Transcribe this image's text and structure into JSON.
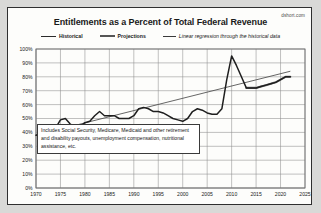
{
  "watermark": "dshort.com",
  "chart_data": {
    "type": "line",
    "title": "Entitlements as a Percent of Total Federal Revenue",
    "xlabel": "",
    "ylabel": "",
    "xlim": [
      1970,
      2025
    ],
    "ylim": [
      0,
      100
    ],
    "grid": true,
    "legend_position": "top",
    "xticks": [
      "1970",
      "1975",
      "1980",
      "1985",
      "1990",
      "1995",
      "2000",
      "2005",
      "2010",
      "2015",
      "2020",
      "2025"
    ],
    "yticks": [
      "0%",
      "10%",
      "20%",
      "30%",
      "40%",
      "50%",
      "60%",
      "70%",
      "80%",
      "90%",
      "100%"
    ],
    "legend": [
      {
        "name": "Historical",
        "style": "solid-dark"
      },
      {
        "name": "Projections",
        "style": "thick-gray"
      },
      {
        "name": "Linear regression through the historical data",
        "style": "thin-line-italic"
      }
    ],
    "annotation": "Includes Social Security, Medicare, Medicaid and other retirement and disability payouts, unemployment compensation, nutritional assistance, etc.",
    "series": [
      {
        "name": "Historical",
        "x": [
          1970,
          1971,
          1972,
          1973,
          1974,
          1975,
          1976,
          1977,
          1978,
          1979,
          1980,
          1981,
          1982,
          1983,
          1984,
          1985,
          1986,
          1987,
          1988,
          1989,
          1990,
          1991,
          1992,
          1993,
          1994,
          1995,
          1996,
          1997,
          1998,
          1999,
          2000,
          2001,
          2002,
          2003,
          2004,
          2005,
          2006,
          2007,
          2008,
          2009,
          2010,
          2011,
          2012,
          2013,
          2014,
          2015,
          2016,
          2017,
          2018,
          2019,
          2020,
          2021,
          2022
        ],
        "values": [
          38,
          39,
          40,
          41,
          43,
          49,
          50,
          46,
          44,
          44,
          47,
          48,
          52,
          55,
          52,
          52,
          52,
          50,
          50,
          50,
          52,
          57,
          58,
          57,
          55,
          55,
          54,
          52,
          50,
          49,
          48,
          50,
          55,
          57,
          56,
          54,
          53,
          53,
          57,
          78,
          95,
          88,
          80,
          72,
          72,
          72,
          73,
          74,
          75,
          76,
          78,
          80,
          80
        ]
      },
      {
        "name": "Projections",
        "x": [
          2013,
          2014,
          2015,
          2016,
          2017,
          2018,
          2019,
          2020,
          2021,
          2022
        ],
        "values": [
          72,
          72,
          72,
          73,
          74,
          75,
          76,
          78,
          80,
          80
        ]
      },
      {
        "name": "Linear regression through the historical data",
        "x": [
          1970,
          2022
        ],
        "values": [
          38,
          84
        ]
      }
    ]
  }
}
